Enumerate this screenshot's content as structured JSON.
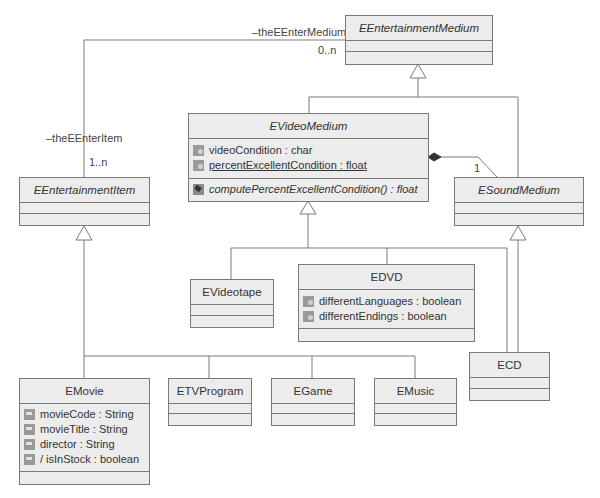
{
  "diagram": {
    "type": "UML class diagram",
    "classes": {
      "entertainment_medium": {
        "name": "EEntertainmentMedium",
        "abstract": true
      },
      "video_medium": {
        "name": "EVideoMedium",
        "abstract": true,
        "attributes": [
          {
            "text": "videoCondition : char",
            "static": false,
            "icon": "attribute-icon"
          },
          {
            "text": "percentExcellentCondition : float",
            "static": true,
            "icon": "attribute-icon"
          }
        ],
        "operations": [
          {
            "text": "computePercentExcellentCondition() : float",
            "abstract": true,
            "icon": "operation-icon"
          }
        ]
      },
      "sound_medium": {
        "name": "ESoundMedium",
        "abstract": true
      },
      "entertainment_item": {
        "name": "EEntertainmentItem",
        "abstract": true
      },
      "videotape": {
        "name": "EVideotape"
      },
      "dvd": {
        "name": "EDVD",
        "attributes": [
          {
            "text": "differentLanguages : boolean",
            "icon": "attribute-icon"
          },
          {
            "text": "differentEndings : boolean",
            "icon": "attribute-icon"
          }
        ]
      },
      "cd": {
        "name": "ECD"
      },
      "movie": {
        "name": "EMovie",
        "attributes": [
          {
            "text": "movieCode : String",
            "icon": "attribute-icon"
          },
          {
            "text": "movieTitle : String",
            "icon": "attribute-icon"
          },
          {
            "text": "director : String",
            "icon": "attribute-icon"
          },
          {
            "text": "/ isInStock : boolean",
            "icon": "attribute-icon"
          }
        ]
      },
      "tv_program": {
        "name": "ETVProgram"
      },
      "game": {
        "name": "EGame"
      },
      "music": {
        "name": "EMusic"
      }
    },
    "associations": {
      "medium_item": {
        "role_medium": "–theEEnterMedium",
        "mult_medium": "0..n",
        "role_item": "–theEEnterItem",
        "mult_item": "1..n"
      },
      "composition": {
        "mult": "1"
      }
    },
    "colors": {
      "box_fill": "#ececec",
      "border": "#7a7a7a",
      "line": "#7a7a7a",
      "text": "#333333"
    }
  }
}
